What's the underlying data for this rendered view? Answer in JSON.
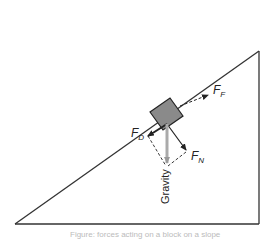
{
  "diagram": {
    "labels": {
      "friction": {
        "main": "F",
        "sub": "F"
      },
      "drag": {
        "main": "F",
        "sub": "D"
      },
      "normal": {
        "main": "F",
        "sub": "N"
      },
      "gravity": "Gravity"
    },
    "colors": {
      "line": "#333333",
      "block": "#8a8a8a",
      "gravity_arrow": "#aaaaaa"
    },
    "caption": "Figure: forces acting on a block on a slope"
  }
}
